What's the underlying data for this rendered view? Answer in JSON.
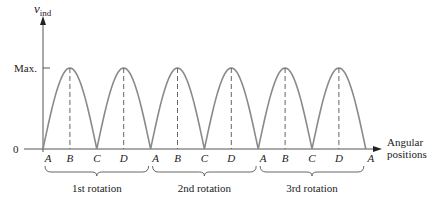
{
  "diagram": {
    "y_axis_label": "v",
    "y_axis_subscript": "ind",
    "y_tick_max": "Max.",
    "y_tick_zero": "0",
    "x_axis_label_line1": "Angular",
    "x_axis_label_line2": "positions",
    "position_labels": [
      "A",
      "B",
      "C",
      "D",
      "A",
      "B",
      "C",
      "D",
      "A",
      "B",
      "C",
      "D",
      "A"
    ],
    "rotation_labels": [
      "1st rotation",
      "2nd rotation",
      "3rd rotation"
    ],
    "curve_color": "#8a8a8a",
    "axis_color": "#555555"
  },
  "chart_data": {
    "type": "line",
    "title": "",
    "xlabel": "Angular positions",
    "ylabel": "v_ind",
    "x": [
      "A",
      "B",
      "C",
      "D",
      "A",
      "B",
      "C",
      "D",
      "A",
      "B",
      "C",
      "D",
      "A"
    ],
    "values": [
      0,
      1,
      0,
      1,
      0,
      1,
      0,
      1,
      0,
      1,
      0,
      1,
      0
    ],
    "ylim": [
      0,
      1
    ],
    "yticks": [
      "0",
      "Max."
    ],
    "grid": false
  }
}
